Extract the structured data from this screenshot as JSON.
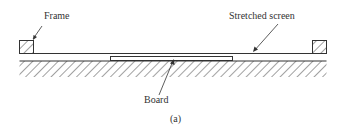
{
  "figure": {
    "labels": {
      "frame": "Frame",
      "stretched_screen": "Stretched screen",
      "board": "Board",
      "caption": "(a)"
    },
    "colors": {
      "ink": "#333333",
      "background": "#ffffff"
    }
  }
}
